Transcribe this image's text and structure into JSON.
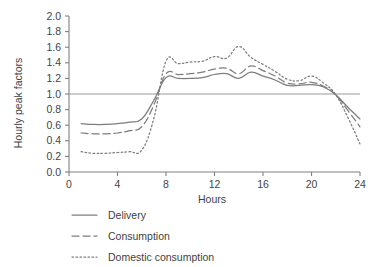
{
  "chart_data": {
    "type": "line",
    "title": "",
    "xlabel": "Hours",
    "ylabel": "Hourly peak factors",
    "xlim": [
      0,
      24
    ],
    "ylim": [
      0.0,
      2.0
    ],
    "xticks": [
      0,
      4,
      8,
      12,
      16,
      20,
      24
    ],
    "xtick_labels": [
      "0",
      "4",
      "8",
      "12",
      "16",
      "20",
      "24"
    ],
    "yticks": [
      0.0,
      0.2,
      0.4,
      0.6,
      0.8,
      1.0,
      1.2,
      1.4,
      1.6,
      1.8,
      2.0
    ],
    "ytick_labels": [
      "0.0",
      "0.2",
      "0.4",
      "0.6",
      "0.8",
      "1.0",
      "1.2",
      "1.4",
      "1.6",
      "1.8",
      "2.0"
    ],
    "grid": false,
    "legend_position": "below-axes-left",
    "reference_lines": [
      {
        "name": "unity-reference-line",
        "orientation": "horizontal",
        "value": 1.0,
        "color": "#9a9a9a"
      }
    ],
    "x": [
      1,
      2,
      3,
      4,
      5,
      6,
      7,
      8,
      9,
      10,
      11,
      12,
      13,
      14,
      15,
      16,
      17,
      18,
      19,
      20,
      21,
      22,
      23,
      24
    ],
    "series": [
      {
        "name": "Delivery",
        "style": "solid",
        "color": "#7d7d7d",
        "values": [
          0.62,
          0.61,
          0.61,
          0.62,
          0.64,
          0.68,
          0.92,
          1.21,
          1.2,
          1.2,
          1.21,
          1.25,
          1.26,
          1.2,
          1.28,
          1.23,
          1.18,
          1.11,
          1.11,
          1.12,
          1.09,
          0.99,
          0.83,
          0.68
        ]
      },
      {
        "name": "Consumption",
        "style": "dashed",
        "color": "#7d7d7d",
        "values": [
          0.5,
          0.49,
          0.49,
          0.5,
          0.53,
          0.58,
          0.86,
          1.26,
          1.25,
          1.26,
          1.28,
          1.32,
          1.33,
          1.26,
          1.36,
          1.3,
          1.23,
          1.14,
          1.13,
          1.15,
          1.1,
          0.99,
          0.79,
          0.58
        ]
      },
      {
        "name": "Domestic consumption",
        "style": "dotted",
        "color": "#7d7d7d",
        "values": [
          0.26,
          0.24,
          0.24,
          0.25,
          0.26,
          0.28,
          0.69,
          1.42,
          1.39,
          1.41,
          1.42,
          1.48,
          1.46,
          1.61,
          1.47,
          1.38,
          1.29,
          1.19,
          1.17,
          1.23,
          1.14,
          0.99,
          0.7,
          0.36
        ]
      }
    ]
  },
  "legend": {
    "items": [
      {
        "label": "Delivery",
        "swatch": "solid-line-swatch"
      },
      {
        "label": "Consumption",
        "swatch": "dashed-line-swatch"
      },
      {
        "label": "Domestic consumption",
        "swatch": "dotted-line-swatch"
      }
    ]
  }
}
